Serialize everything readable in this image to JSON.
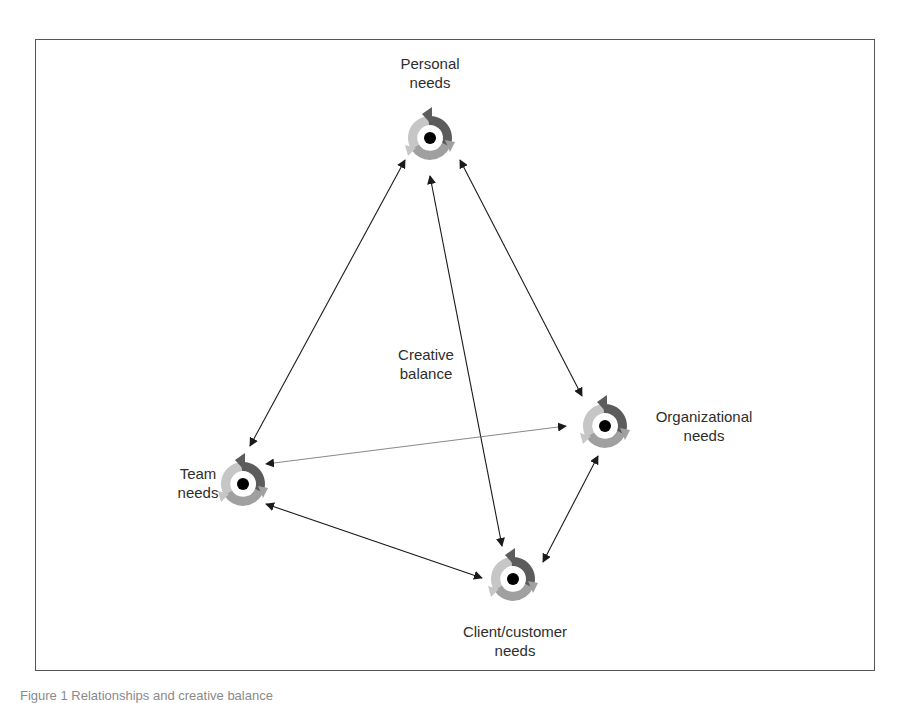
{
  "figure": {
    "title": "Creative balance",
    "caption": "Figure 1 Relationships and creative balance"
  },
  "nodes": [
    {
      "id": "personal",
      "label_line1": "Personal",
      "label_line2": "needs",
      "cx": 430,
      "cy": 138
    },
    {
      "id": "organizational",
      "label_line1": "Organizational",
      "label_line2": "needs",
      "cx": 605,
      "cy": 426
    },
    {
      "id": "team",
      "label_line1": "Team",
      "label_line2": "needs",
      "cx": 243,
      "cy": 484
    },
    {
      "id": "client",
      "label_line1": "Client/customer",
      "label_line2": "needs",
      "cx": 513,
      "cy": 579
    }
  ],
  "center_label": {
    "line1": "Creative",
    "line2": "balance"
  },
  "edges": [
    {
      "from": "personal",
      "to": "team",
      "type": "bidirectional"
    },
    {
      "from": "personal",
      "to": "client",
      "type": "bidirectional"
    },
    {
      "from": "personal",
      "to": "organizational",
      "type": "bidirectional"
    },
    {
      "from": "team",
      "to": "organizational",
      "type": "bidirectional",
      "style": "thin"
    },
    {
      "from": "team",
      "to": "client",
      "type": "bidirectional"
    },
    {
      "from": "organizational",
      "to": "client",
      "type": "bidirectional"
    }
  ],
  "icon": {
    "name": "cycle-arrows-icon",
    "colors": {
      "dark": "#5a5a5a",
      "medium": "#9a9a9a",
      "light": "#c4c4c4",
      "center": "#000000"
    }
  }
}
